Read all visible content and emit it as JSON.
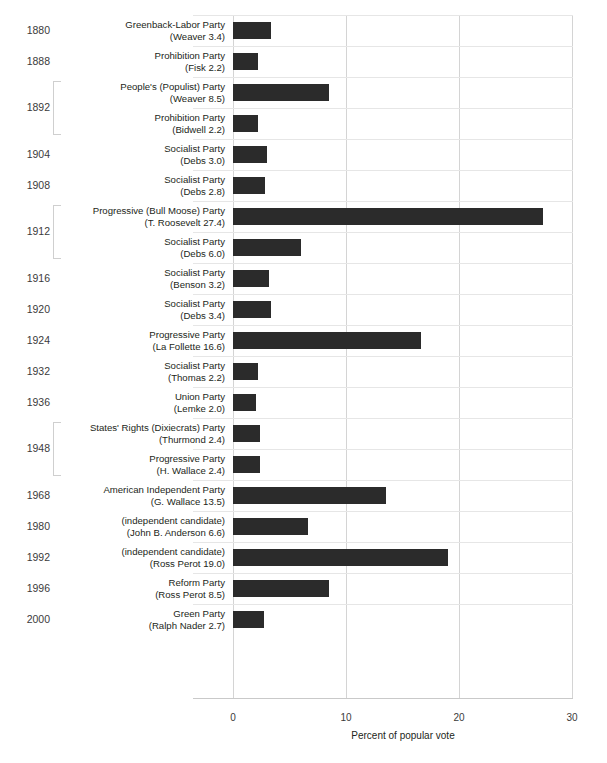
{
  "chart_data": {
    "type": "bar",
    "orientation": "horizontal",
    "title": "",
    "xlabel": "Percent of popular vote",
    "ylabel": "",
    "xlim": [
      0,
      30
    ],
    "xticks": [
      0,
      10,
      20,
      30
    ],
    "grid": "vertical",
    "legend": "none",
    "bar_color": "#2b2b2b",
    "categories": [
      "Greenback-Labor Party (Weaver 3.4)",
      "Prohibition Party (Fisk 2.2)",
      "People's (Populist) Party (Weaver 8.5)",
      "Prohibition Party (Bidwell 2.2)",
      "Socialist Party (Debs 3.0)",
      "Socialist Party (Debs 2.8)",
      "Progressive (Bull Moose) Party (T. Roosevelt 27.4)",
      "Socialist Party (Debs 6.0)",
      "Socialist Party (Benson 3.2)",
      "Socialist Party (Debs 3.4)",
      "Progressive Party (La Follette 16.6)",
      "Socialist Party (Thomas 2.2)",
      "Union Party (Lemke 2.0)",
      "States' Rights (Dixiecrats) Party (Thurmond 2.4)",
      "Progressive Party (H. Wallace 2.4)",
      "American Independent Party (G. Wallace 13.5)",
      "(independent candidate) (John B. Anderson 6.6)",
      "(independent candidate) (Ross Perot 19.0)",
      "Reform Party (Ross Perot 8.5)",
      "Green Party (Ralph Nader 2.7)"
    ],
    "values": [
      3.4,
      2.2,
      8.5,
      2.2,
      3.0,
      2.8,
      27.4,
      6.0,
      3.2,
      3.4,
      16.6,
      2.2,
      2.0,
      2.4,
      2.4,
      13.5,
      6.6,
      19.0,
      8.5,
      2.7
    ],
    "years": [
      1880,
      1888,
      1892,
      1892,
      1904,
      1908,
      1912,
      1912,
      1916,
      1920,
      1924,
      1932,
      1936,
      1948,
      1948,
      1968,
      1980,
      1992,
      1996,
      2000
    ]
  },
  "axis": {
    "xlabel": "Percent of popular vote",
    "ticks": [
      {
        "label": "0",
        "value": 0
      },
      {
        "label": "10",
        "value": 10
      },
      {
        "label": "20",
        "value": 20
      },
      {
        "label": "30",
        "value": 30
      }
    ]
  },
  "rows": [
    {
      "year": "1880",
      "grouped": false,
      "party": "Greenback-Labor Party",
      "candidate": "(Weaver 3.4)",
      "value": 3.4
    },
    {
      "year": "1888",
      "grouped": false,
      "party": "Prohibition Party",
      "candidate": "(Fisk 2.2)",
      "value": 2.2
    },
    {
      "year": "1892",
      "grouped": true,
      "party": "People's (Populist) Party",
      "candidate": "(Weaver 8.5)",
      "value": 8.5
    },
    {
      "year": "1892",
      "grouped": true,
      "party": "Prohibition Party",
      "candidate": "(Bidwell 2.2)",
      "value": 2.2
    },
    {
      "year": "1904",
      "grouped": false,
      "party": "Socialist Party",
      "candidate": "(Debs 3.0)",
      "value": 3.0
    },
    {
      "year": "1908",
      "grouped": false,
      "party": "Socialist Party",
      "candidate": "(Debs 2.8)",
      "value": 2.8
    },
    {
      "year": "1912",
      "grouped": true,
      "party": "Progressive (Bull Moose) Party",
      "candidate": "(T. Roosevelt 27.4)",
      "value": 27.4
    },
    {
      "year": "1912",
      "grouped": true,
      "party": "Socialist Party",
      "candidate": "(Debs 6.0)",
      "value": 6.0
    },
    {
      "year": "1916",
      "grouped": false,
      "party": "Socialist Party",
      "candidate": "(Benson 3.2)",
      "value": 3.2
    },
    {
      "year": "1920",
      "grouped": false,
      "party": "Socialist Party",
      "candidate": "(Debs 3.4)",
      "value": 3.4
    },
    {
      "year": "1924",
      "grouped": false,
      "party": "Progressive Party",
      "candidate": "(La Follette 16.6)",
      "value": 16.6
    },
    {
      "year": "1932",
      "grouped": false,
      "party": "Socialist Party",
      "candidate": "(Thomas 2.2)",
      "value": 2.2
    },
    {
      "year": "1936",
      "grouped": false,
      "party": "Union Party",
      "candidate": "(Lemke 2.0)",
      "value": 2.0
    },
    {
      "year": "1948",
      "grouped": true,
      "party": "States' Rights (Dixiecrats) Party",
      "candidate": "(Thurmond 2.4)",
      "value": 2.4
    },
    {
      "year": "1948",
      "grouped": true,
      "party": "Progressive Party",
      "candidate": "(H. Wallace 2.4)",
      "value": 2.4
    },
    {
      "year": "1968",
      "grouped": false,
      "party": "American Independent Party",
      "candidate": "(G. Wallace 13.5)",
      "value": 13.5
    },
    {
      "year": "1980",
      "grouped": false,
      "party": "(independent candidate)",
      "candidate": "(John B. Anderson 6.6)",
      "value": 6.6
    },
    {
      "year": "1992",
      "grouped": false,
      "party": "(independent candidate)",
      "candidate": "(Ross Perot 19.0)",
      "value": 19.0
    },
    {
      "year": "1996",
      "grouped": false,
      "party": "Reform Party",
      "candidate": "(Ross Perot 8.5)",
      "value": 8.5
    },
    {
      "year": "2000",
      "grouped": false,
      "party": "Green Party",
      "candidate": "(Ralph Nader 2.7)",
      "value": 2.7
    }
  ],
  "groups": [
    {
      "year": "1892",
      "start_row": 2,
      "end_row": 3
    },
    {
      "year": "1912",
      "start_row": 6,
      "end_row": 7
    },
    {
      "year": "1948",
      "start_row": 13,
      "end_row": 14
    }
  ]
}
